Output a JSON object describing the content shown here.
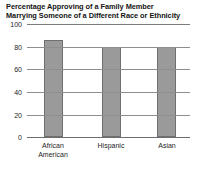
{
  "chart_data": {
    "type": "bar",
    "title": "Percentage Approving of a Family Member\nMarrying Someone of a Different Race or Ethnicity",
    "title_line1": "Percentage Approving of a Family Member",
    "title_line2": "Marrying Someone of a Different Race or Ethnicity",
    "categories": [
      "African American",
      "Hispanic",
      "Asian"
    ],
    "category_labels": [
      "African\nAmerican",
      "Hispanic",
      "Asian"
    ],
    "values": [
      86,
      80,
      80
    ],
    "xlabel": "",
    "ylabel": "",
    "ylim": [
      0,
      100
    ],
    "yticks": [
      0,
      20,
      40,
      60,
      80,
      100
    ],
    "ytick_labels": [
      "0",
      "20",
      "40",
      "60",
      "80",
      "100"
    ],
    "grid": true,
    "legend": false,
    "bar_color": "#9a9a9a",
    "bar_edge_color": "#6f6f6f",
    "grid_color": "#8e8e8e",
    "background_color": "#ffffff"
  }
}
